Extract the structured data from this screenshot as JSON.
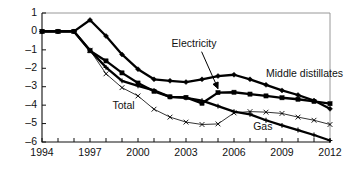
{
  "chart_data": {
    "type": "line",
    "title": "",
    "subtitle": "",
    "xlabel": "",
    "ylabel": "",
    "xlim": [
      1994,
      2012
    ],
    "ylim": [
      -6,
      1
    ],
    "yticks": [
      1,
      0,
      -1,
      -2,
      -3,
      -4,
      -5,
      -6
    ],
    "ytick_labels": [
      "1",
      "0",
      "–1",
      "–2",
      "–3",
      "–4",
      "–5",
      "–6"
    ],
    "xticks": [
      1994,
      1995,
      1996,
      1997,
      1998,
      1999,
      2000,
      2001,
      2002,
      2003,
      2004,
      2005,
      2006,
      2007,
      2008,
      2009,
      2010,
      2011,
      2012
    ],
    "xtick_labels_shown": [
      "1994",
      "1997",
      "2000",
      "2003",
      "2006",
      "2009",
      "2012"
    ],
    "xtick_labels_shown_values": [
      1994,
      1997,
      2000,
      2003,
      2006,
      2009,
      2012
    ],
    "grid": false,
    "legend": "inline-annotations",
    "legend_position": "inline",
    "x": [
      1994,
      1995,
      1996,
      1997,
      1998,
      1999,
      2000,
      2001,
      2002,
      2003,
      2004,
      2005,
      2006,
      2007,
      2008,
      2009,
      2010,
      2011,
      2012
    ],
    "series": [
      {
        "name": "Middle distillates",
        "marker": "diamond",
        "line": "thick",
        "values": [
          0,
          0,
          0,
          0.62,
          -0.25,
          -1.25,
          -2.05,
          -2.6,
          -2.68,
          -2.75,
          -2.6,
          -2.42,
          -2.35,
          -2.6,
          -2.9,
          -3.2,
          -3.45,
          -3.75,
          -4.2
        ]
      },
      {
        "name": "Electricity",
        "marker": "square",
        "line": "thick",
        "values": [
          0,
          0,
          0,
          -1.05,
          -1.6,
          -2.25,
          -2.8,
          -3.25,
          -3.55,
          -3.58,
          -3.9,
          -3.32,
          -3.3,
          -3.4,
          -3.5,
          -3.6,
          -3.68,
          -3.8,
          -3.92
        ]
      },
      {
        "name": "Gas",
        "marker": "plus",
        "line": "thick",
        "values": [
          0,
          0,
          0,
          -1.02,
          -1.95,
          -2.68,
          -2.95,
          -3.2,
          -3.55,
          -3.6,
          -3.75,
          -4.05,
          -4.35,
          -4.5,
          -4.82,
          -5.1,
          -5.35,
          -5.62,
          -5.92
        ]
      },
      {
        "name": "Total",
        "marker": "x",
        "line": "thin",
        "values": [
          0,
          0,
          0,
          -1.02,
          -2.3,
          -3.05,
          -3.5,
          -4.22,
          -4.65,
          -4.92,
          -5.05,
          -5.02,
          -4.42,
          -4.35,
          -4.38,
          -4.45,
          -4.65,
          -4.82,
          -5.05
        ]
      }
    ],
    "annotations": [
      {
        "name": "electricity",
        "text": "Electricity",
        "x": 2002.1,
        "y": -0.72,
        "leader_to_x": 2005.0,
        "leader_to_y": -3.32,
        "arrow": true
      },
      {
        "name": "middle-distillates",
        "text": "Middle distillates",
        "x": 2008.0,
        "y": -2.32,
        "arrow": false
      },
      {
        "name": "total",
        "text": "Total",
        "x": 1998.4,
        "y": -4.08,
        "arrow": false
      },
      {
        "name": "gas",
        "text": "Gas",
        "x": 2007.2,
        "y": -5.18,
        "arrow": false
      }
    ]
  },
  "colors": {
    "line": "#000000",
    "frame": "#8d8d8d",
    "axis": "#111111",
    "background": "#ffffff",
    "text": "#111111"
  }
}
